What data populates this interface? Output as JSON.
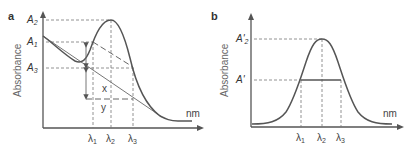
{
  "panels": [
    {
      "id": "a",
      "label": "a",
      "ylabel": "Absorbance",
      "xunit": "nm",
      "y_labels": [
        {
          "base": "A",
          "sub": "2"
        },
        {
          "base": "A",
          "sub": "1"
        },
        {
          "base": "A",
          "sub": "3"
        }
      ],
      "x_labels": [
        {
          "base": "λ",
          "sub": "1"
        },
        {
          "base": "λ",
          "sub": "2"
        },
        {
          "base": "λ",
          "sub": "3"
        }
      ],
      "annotations": {
        "x": "x",
        "y": "y"
      }
    },
    {
      "id": "b",
      "label": "b",
      "ylabel": "Absorbance",
      "xunit": "nm",
      "y_labels": [
        {
          "base": "A'",
          "sub": "2"
        },
        {
          "base": "A'",
          "sub": ""
        }
      ],
      "x_labels": [
        {
          "base": "λ",
          "sub": "1"
        },
        {
          "base": "λ",
          "sub": "2"
        },
        {
          "base": "λ",
          "sub": "3"
        }
      ]
    }
  ]
}
